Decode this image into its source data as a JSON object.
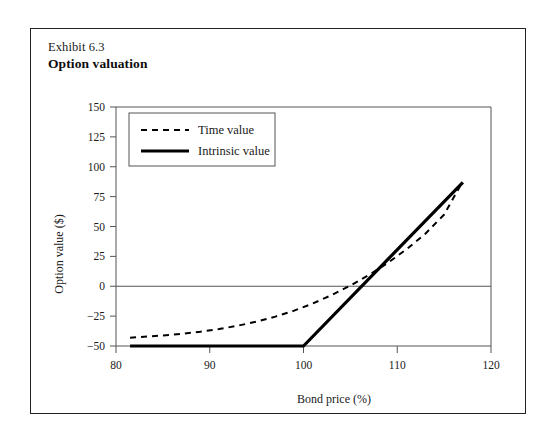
{
  "figure": {
    "exhibit_number": "Exhibit 6.3",
    "title": "Option valuation"
  },
  "chart_data": {
    "type": "line",
    "title": "Option valuation",
    "xlabel": "Bond price (%)",
    "ylabel": "Option value ($)",
    "xlim": [
      80,
      120
    ],
    "ylim": [
      -50,
      150
    ],
    "xticks": [
      80,
      90,
      100,
      110,
      120
    ],
    "yticks": [
      -50,
      -25,
      0,
      25,
      50,
      75,
      100,
      125,
      150
    ],
    "grid": false,
    "zero_line": true,
    "legend_position": "top-left",
    "series": [
      {
        "name": "Time value",
        "style": "dashed",
        "color": "#000000",
        "points": [
          [
            81.5,
            -43.0
          ],
          [
            83.0,
            -42.3
          ],
          [
            85.0,
            -41.2
          ],
          [
            87.0,
            -39.8
          ],
          [
            89.0,
            -38.0
          ],
          [
            91.0,
            -35.8
          ],
          [
            93.0,
            -33.0
          ],
          [
            95.0,
            -29.6
          ],
          [
            97.0,
            -25.4
          ],
          [
            99.0,
            -20.4
          ],
          [
            101.0,
            -14.4
          ],
          [
            103.0,
            -7.4
          ],
          [
            105.0,
            0.6
          ],
          [
            107.0,
            9.6
          ],
          [
            109.0,
            19.6
          ],
          [
            111.0,
            31.0
          ],
          [
            113.0,
            44.0
          ],
          [
            115.0,
            60.0
          ],
          [
            117.0,
            88.0
          ]
        ]
      },
      {
        "name": "Intrinsic value",
        "style": "solid",
        "color": "#000000",
        "points": [
          [
            81.5,
            -50.0
          ],
          [
            100.0,
            -50.0
          ],
          [
            117.0,
            87.0
          ]
        ]
      }
    ],
    "legend": [
      {
        "label": "Time value",
        "style": "dashed"
      },
      {
        "label": "Intrinsic value",
        "style": "solid"
      }
    ]
  },
  "colors": {
    "frame": "#222222",
    "axis": "#555555",
    "line": "#000000",
    "text": "#1a1a1a"
  }
}
